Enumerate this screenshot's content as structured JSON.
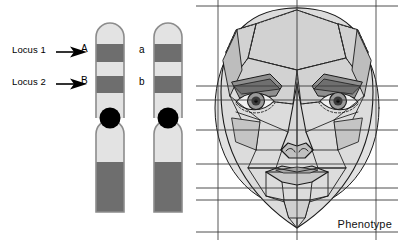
{
  "figure": {
    "background_color": "#ffffff"
  },
  "karyotype": {
    "loci": [
      {
        "id": "locus-1",
        "label": "Locus 1",
        "arrow": "right-arrow-icon",
        "allele_dominant": "A",
        "allele_recessive": "a"
      },
      {
        "id": "locus-2",
        "label": "Locus 2",
        "arrow": "right-arrow-icon",
        "allele_dominant": "B",
        "allele_recessive": "b"
      }
    ],
    "chromosomes": [
      {
        "id": "chromosome-left",
        "name": "maternal-homolog",
        "alleles": [
          "A",
          "B"
        ]
      },
      {
        "id": "chromosome-right",
        "name": "paternal-homolog",
        "alleles": [
          "a",
          "b"
        ]
      }
    ],
    "centromere": {
      "name": "centromere",
      "color": "#000000"
    },
    "band_colors": {
      "light_band": "#e3e3e3",
      "dark_band": "#6e6e6e",
      "outline": "#8c8c8c",
      "terminal_dark_band": "#6e6e6e"
    }
  },
  "phenotype": {
    "label": "Phenotype",
    "image_name": "facial-mesh-diagram",
    "description": "Polygonal wireframe human face with landmark mesh, dotted cranial tessellation and horizontal measurement guide lines",
    "colors": {
      "mesh_line": "#1a1a1a",
      "dotted_line": "#2b2b2b",
      "fill_light": "#e2e2e2",
      "fill_mid": "#c9c9c9",
      "fill_dark": "#a8a8a8",
      "guide_line": "#3a3a3a"
    }
  }
}
